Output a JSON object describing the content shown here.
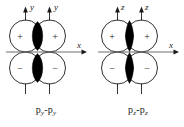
{
  "figure": {
    "background_color": "#ffffff",
    "stroke_color": "#1a1a1a",
    "lobe_fill_color": "#000000",
    "panels": [
      {
        "id": "p-y-overlap",
        "caption_prefix": "p",
        "caption_sub_left": "y",
        "caption_dash": "-",
        "caption_sub_right": "y",
        "caption_text": "py-py",
        "vertical_axis_label": "y",
        "horizontal_axis_label": "x",
        "signs": {
          "top_left": "+",
          "top_right": "+",
          "bottom_left": "−",
          "bottom_right": "−"
        },
        "lens_width": 14,
        "lens_style": "broad"
      },
      {
        "id": "p-z-overlap",
        "caption_prefix": "p",
        "caption_sub_left": "z",
        "caption_dash": "-",
        "caption_sub_right": "z",
        "caption_text": "pz-pz",
        "vertical_axis_label": "z",
        "horizontal_axis_label": "x",
        "signs": {
          "top_left": "+",
          "top_right": "+",
          "bottom_left": "−",
          "bottom_right": "−"
        },
        "lens_width": 10,
        "lens_style": "narrow"
      }
    ]
  }
}
